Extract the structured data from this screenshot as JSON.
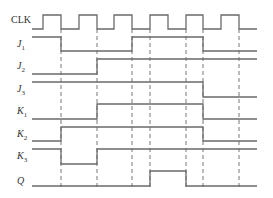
{
  "diagram": {
    "x_start": 32,
    "x_end": 257,
    "dashed_lines": {
      "x": [
        61,
        97,
        132,
        150,
        186,
        203,
        239
      ],
      "y_top": 29,
      "y_bottom": 190
    },
    "signals": [
      {
        "id": "clk",
        "name": "CLK",
        "sub": "",
        "label_y": 23,
        "y_high": 15,
        "y_low": 29,
        "initial": 0,
        "transitions": [
          43,
          61,
          79,
          97,
          114,
          132,
          150,
          168,
          186,
          203,
          221,
          239
        ]
      },
      {
        "id": "j1",
        "name": "J",
        "sub": "1",
        "label_y": 47,
        "y_high": 37,
        "y_low": 51,
        "initial": 1,
        "transitions": [
          61,
          132,
          203
        ]
      },
      {
        "id": "j2",
        "name": "J",
        "sub": "2",
        "label_y": 69,
        "y_high": 59,
        "y_low": 74,
        "initial": 0,
        "transitions": [
          97
        ]
      },
      {
        "id": "j3",
        "name": "J",
        "sub": "3",
        "label_y": 92,
        "y_high": 82,
        "y_low": 97,
        "initial": 1,
        "transitions": [
          203
        ]
      },
      {
        "id": "k1",
        "name": "K",
        "sub": "1",
        "label_y": 114,
        "y_high": 104,
        "y_low": 119,
        "initial": 0,
        "transitions": [
          97,
          203
        ]
      },
      {
        "id": "k2",
        "name": "K",
        "sub": "2",
        "label_y": 137,
        "y_high": 127,
        "y_low": 141,
        "initial": 0,
        "transitions": [
          61,
          203
        ]
      },
      {
        "id": "k3",
        "name": "K",
        "sub": "3",
        "label_y": 159,
        "y_high": 149,
        "y_low": 164,
        "initial": 1,
        "transitions": [
          61,
          97
        ]
      },
      {
        "id": "q",
        "name": "Q",
        "sub": "",
        "label_y": 184,
        "y_high": 171,
        "y_low": 186,
        "initial": 0,
        "transitions": [
          150,
          186
        ]
      }
    ],
    "colors": {
      "line": "#6a6a6a",
      "text": "#333333",
      "background": "#ffffff"
    }
  }
}
